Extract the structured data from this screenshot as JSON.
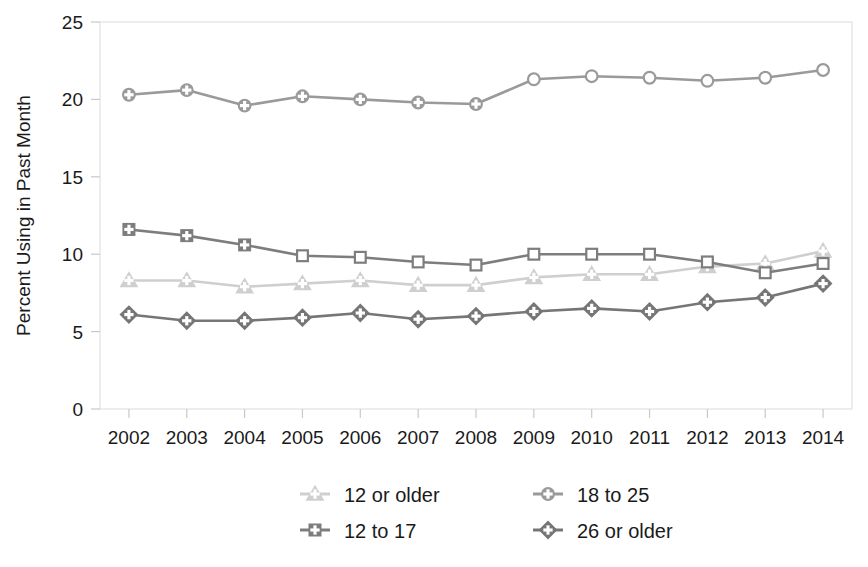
{
  "chart_data": {
    "type": "line",
    "title": "",
    "xlabel": "",
    "ylabel": "Percent Using in Past Month",
    "categories": [
      "2002",
      "2003",
      "2004",
      "2005",
      "2006",
      "2007",
      "2008",
      "2009",
      "2010",
      "2011",
      "2012",
      "2013",
      "2014"
    ],
    "x": [
      2002,
      2003,
      2004,
      2005,
      2006,
      2007,
      2008,
      2009,
      2010,
      2011,
      2012,
      2013,
      2014
    ],
    "xlim": [
      2001.5,
      2014.5
    ],
    "ylim": [
      0,
      25
    ],
    "yticks": [
      0,
      5,
      10,
      15,
      20,
      25
    ],
    "ytick_labels": [
      "0",
      "5",
      "10",
      "15",
      "20",
      "25"
    ],
    "grid": false,
    "legend_position": "bottom",
    "series": [
      {
        "name": "12 or older",
        "marker": "triangle",
        "color": "#cfcfcf",
        "values": [
          8.3,
          8.3,
          7.9,
          8.1,
          8.3,
          8.0,
          8.0,
          8.5,
          8.7,
          8.7,
          9.2,
          9.4,
          10.2
        ]
      },
      {
        "name": "12 to 17",
        "marker": "square",
        "color": "#7d7d7d",
        "values": [
          11.6,
          11.2,
          10.6,
          9.9,
          9.8,
          9.5,
          9.3,
          10.0,
          10.0,
          10.0,
          9.5,
          8.8,
          9.4
        ]
      },
      {
        "name": "18 to 25",
        "marker": "circle",
        "color": "#9a9a9a",
        "values": [
          20.3,
          20.6,
          19.6,
          20.2,
          20.0,
          19.8,
          19.7,
          21.3,
          21.5,
          21.4,
          21.2,
          21.4,
          21.9
        ]
      },
      {
        "name": "26 or older",
        "marker": "diamond",
        "color": "#767676",
        "values": [
          6.1,
          5.7,
          5.7,
          5.9,
          6.2,
          5.8,
          6.0,
          6.3,
          6.5,
          6.3,
          6.9,
          7.2,
          8.1
        ]
      }
    ]
  },
  "legend": {
    "entries": [
      {
        "label": "12 or older",
        "marker": "triangle",
        "color": "#cfcfcf"
      },
      {
        "label": "18 to 25",
        "marker": "circle",
        "color": "#9a9a9a"
      },
      {
        "label": "12 to 17",
        "marker": "square",
        "color": "#7d7d7d"
      },
      {
        "label": "26 or older",
        "marker": "diamond",
        "color": "#767676"
      }
    ]
  },
  "axes": {
    "y_title": "Percent Using in Past Month"
  }
}
